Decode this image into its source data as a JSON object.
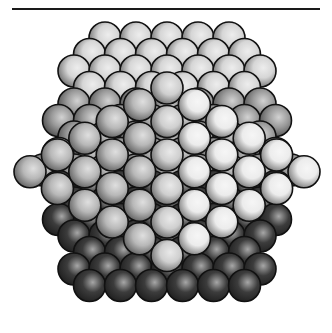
{
  "figure": {
    "label": "",
    "rule_color": "#1a1a1a"
  },
  "sphere_style": {
    "radius": 16,
    "outline_color": "#111111",
    "outline_width": 1.6
  },
  "back_layer": {
    "row_start_y": 38,
    "row_end_y": 300,
    "row_step_y": 16.5,
    "col_step_x": 31,
    "center_x": 167,
    "silhouette": {
      "top_half_width": 84,
      "mid_y": 168,
      "mid_half_width": 136,
      "bottom_half_width": 82
    },
    "shades": {
      "top": "#d6d6d6",
      "upper_side": "#9a9a9a",
      "lower": "#3c3c3c"
    }
  },
  "front_face": {
    "center_x": 167,
    "col_step_x": 27.4,
    "row_step_y": 33.5,
    "center_column_top_y": 88,
    "columns": [
      1,
      2,
      3,
      4,
      5,
      6,
      5,
      4,
      3,
      2,
      1
    ],
    "shade_left": "#b8b8b8",
    "shade_right": "#ececec",
    "shade_center": "#cfcfcf"
  }
}
